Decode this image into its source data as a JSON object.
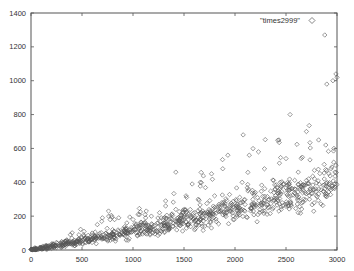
{
  "chart_data": {
    "type": "scatter",
    "title": "",
    "xlabel": "",
    "ylabel": "",
    "xlim": [
      0,
      3000
    ],
    "ylim": [
      0,
      1400
    ],
    "grid": false,
    "legend_position": "top-right inside",
    "x_ticks": [
      0,
      500,
      1000,
      1500,
      2000,
      2500,
      3000
    ],
    "y_ticks": [
      0,
      200,
      400,
      600,
      800,
      1000,
      1200,
      1400
    ],
    "series": [
      {
        "name": "\"times2999\"",
        "marker": "diamond-open",
        "color": "#555555",
        "trend": "roughly linear, y ≈ 0.1·x near origin rising to ≈ 0.13·x, spread grows with x",
        "points": [
          [
            2880,
            1270
          ],
          [
            2960,
            1000
          ],
          [
            2990,
            1040
          ],
          [
            2900,
            980
          ],
          [
            3000,
            1020
          ],
          [
            2080,
            680
          ],
          [
            2540,
            800
          ],
          [
            2430,
            650
          ],
          [
            2700,
            700
          ],
          [
            2820,
            650
          ],
          [
            2230,
            580
          ],
          [
            1930,
            560
          ],
          [
            2140,
            560
          ],
          [
            2890,
            620
          ],
          [
            2970,
            600
          ],
          [
            1420,
            460
          ],
          [
            1770,
            450
          ],
          [
            1880,
            480
          ],
          [
            2500,
            540
          ],
          [
            2620,
            460
          ],
          [
            2070,
            400
          ],
          [
            2200,
            340
          ],
          [
            1580,
            390
          ],
          [
            1660,
            400
          ],
          [
            2780,
            420
          ],
          [
            2900,
            470
          ],
          [
            2950,
            490
          ],
          [
            2990,
            500
          ],
          [
            2820,
            360
          ],
          [
            2680,
            380
          ],
          [
            1640,
            300
          ],
          [
            1800,
            320
          ],
          [
            1520,
            320
          ],
          [
            1320,
            290
          ],
          [
            1320,
            260
          ],
          [
            2290,
            250
          ],
          [
            2430,
            230
          ],
          [
            2520,
            260
          ],
          [
            2620,
            220
          ],
          [
            2730,
            300
          ],
          [
            1050,
            210
          ],
          [
            1130,
            230
          ],
          [
            1180,
            200
          ],
          [
            1260,
            220
          ],
          [
            1420,
            240
          ],
          [
            1000,
            180
          ],
          [
            940,
            160
          ],
          [
            860,
            190
          ],
          [
            760,
            230
          ],
          [
            650,
            150
          ],
          [
            700,
            190
          ],
          [
            800,
            120
          ],
          [
            600,
            100
          ],
          [
            520,
            110
          ],
          [
            470,
            90
          ],
          [
            400,
            70
          ],
          [
            350,
            60
          ],
          [
            300,
            50
          ],
          [
            250,
            45
          ],
          [
            200,
            35
          ],
          [
            150,
            25
          ],
          [
            100,
            15
          ],
          [
            50,
            8
          ],
          [
            20,
            3
          ],
          [
            10,
            1
          ]
        ]
      }
    ]
  },
  "legend": {
    "label": "\"times2999\""
  },
  "axes": {
    "x_tick_labels": [
      "0",
      "500",
      "1000",
      "1500",
      "2000",
      "2500",
      "3000"
    ],
    "y_tick_labels": [
      "0",
      "200",
      "400",
      "600",
      "800",
      "1000",
      "1200",
      "1400"
    ]
  }
}
